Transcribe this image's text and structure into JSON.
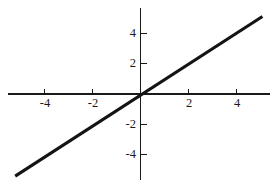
{
  "chart_data": {
    "type": "line",
    "title": "",
    "subtitle": "",
    "xlabel": "",
    "ylabel": "",
    "xlim": [
      -5.55,
      5.45
    ],
    "ylim": [
      -5.75,
      5.75
    ],
    "grid": false,
    "legend": null,
    "annotations": [],
    "x_ticks": [
      -4,
      -2,
      2,
      4
    ],
    "x_tick_labels": [
      "-4",
      "-2",
      "2",
      "4"
    ],
    "y_ticks": [
      -4,
      -2,
      2,
      4
    ],
    "y_tick_labels": [
      "-4",
      "-2",
      "2",
      "4"
    ],
    "series": [
      {
        "name": "y = x",
        "equation": "y = x",
        "slope": 1,
        "intercept": 0,
        "color": "#141414",
        "x": [
          -5.2,
          5.1
        ],
        "values": [
          -5.4,
          5.1
        ],
        "points": [
          {
            "x": -5.2,
            "y": -5.4
          },
          {
            "x": 5.1,
            "y": 5.1
          }
        ]
      }
    ],
    "axes": {
      "x_axis_color": "#1a1a1a",
      "y_axis_color": "#1a1a1a",
      "x_axis_range_px": [
        8,
        270
      ],
      "y_axis_range_px": [
        8,
        180
      ],
      "origin_px": {
        "x": 140,
        "y": 94
      },
      "px_per_unit_x": 24.0,
      "px_per_unit_y": 15.2
    }
  },
  "figure": {
    "background_color": "#ffffff",
    "width": 280,
    "height": 184
  }
}
